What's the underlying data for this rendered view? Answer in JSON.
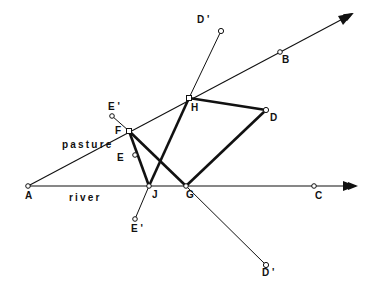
{
  "diagram": {
    "title": "",
    "colors": {
      "line": "#111111",
      "background": "#ffffff"
    },
    "region_labels": {
      "pasture": "pasture",
      "river": "river"
    },
    "points": {
      "A": {
        "label": "A",
        "x": 28,
        "y": 186
      },
      "B": {
        "label": "B",
        "x": 280,
        "y": 52
      },
      "C": {
        "label": "C",
        "x": 314,
        "y": 186
      },
      "D": {
        "label": "D",
        "x": 266,
        "y": 110
      },
      "D1": {
        "label": "D '",
        "x": 221,
        "y": 31
      },
      "D2": {
        "label": "D '",
        "x": 266,
        "y": 265
      },
      "E": {
        "label": "E",
        "x": 135,
        "y": 155
      },
      "E1": {
        "label": "E '",
        "x": 112,
        "y": 116
      },
      "E2": {
        "label": "E '",
        "x": 135,
        "y": 219
      },
      "F": {
        "label": "F",
        "x": 129,
        "y": 131
      },
      "G": {
        "label": "G",
        "x": 186,
        "y": 186
      },
      "H": {
        "label": "H",
        "x": 189,
        "y": 98
      },
      "J": {
        "label": "J",
        "x": 149,
        "y": 186
      }
    },
    "rays": [
      {
        "from": "A",
        "through": "B",
        "arrow": true,
        "name": "pasture-edge"
      },
      {
        "from": "A",
        "through": "C",
        "arrow": true,
        "name": "river-edge"
      }
    ],
    "thin_segments": [
      [
        "H",
        "D1"
      ],
      [
        "G",
        "D2"
      ],
      [
        "F",
        "E1"
      ],
      [
        "J",
        "E2"
      ]
    ],
    "thick_segments": [
      [
        "F",
        "J"
      ],
      [
        "F",
        "G"
      ],
      [
        "J",
        "H"
      ],
      [
        "H",
        "D"
      ],
      [
        "D",
        "G"
      ]
    ]
  }
}
